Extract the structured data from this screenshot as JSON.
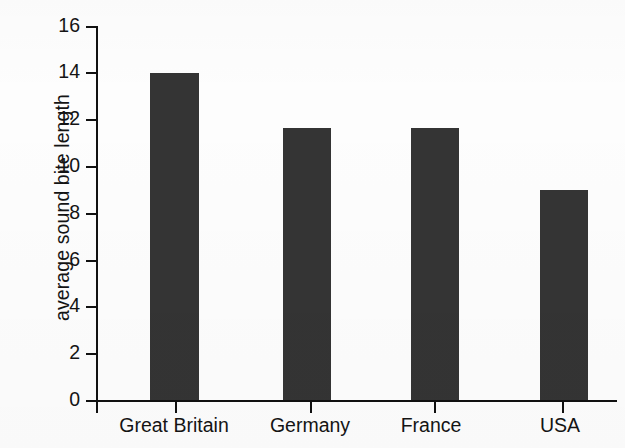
{
  "chart_data": {
    "type": "bar",
    "title": "",
    "subtitle": "",
    "xlabel": "",
    "ylabel": "average sound bite length",
    "categories": [
      "Great Britain",
      "Germany",
      "France",
      "USA"
    ],
    "values": [
      14.0,
      11.65,
      11.65,
      9.0
    ],
    "series": [
      {
        "name": "average sound bite length",
        "values": [
          14.0,
          11.65,
          11.65,
          9.0
        ]
      }
    ],
    "ylim": [
      0,
      16
    ],
    "y_ticks": [
      0,
      2,
      4,
      6,
      8,
      10,
      12,
      14,
      16
    ],
    "y_tick_labels": [
      "0",
      "2",
      "4",
      "6",
      "8",
      "10",
      "12",
      "14",
      "16"
    ],
    "grid": false,
    "legend": false,
    "legend_position": "none",
    "bar_color": "#343434",
    "axis_color": "#111111",
    "text_color": "#141414",
    "background_color": "#fdfdfd",
    "annotations": []
  },
  "figure": {
    "y_axis_label": "average sound bite length"
  }
}
